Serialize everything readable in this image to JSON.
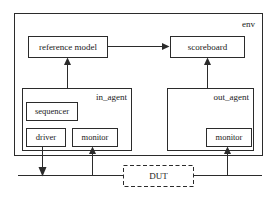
{
  "diagram": {
    "colors": {
      "stroke": "#2b2b2b",
      "background": "#ffffff",
      "text": "#1a1a1a"
    },
    "containers": [
      {
        "id": "env",
        "label": "env",
        "style": "solid",
        "x": 14,
        "y": 13,
        "w": 248,
        "h": 142,
        "label_x": 255,
        "label_y": 25
      },
      {
        "id": "in_agent",
        "label": "in_agent",
        "style": "solid",
        "x": 22,
        "y": 88,
        "w": 109,
        "h": 62,
        "label_x": 126,
        "label_y": 99
      },
      {
        "id": "out_agent",
        "label": "out_agent",
        "style": "solid",
        "x": 167,
        "y": 88,
        "w": 86,
        "h": 62,
        "label_x": 248,
        "label_y": 99
      }
    ],
    "blocks": [
      {
        "id": "reference_model",
        "label": "reference model",
        "style": "solid",
        "x": 28,
        "y": 36,
        "w": 79,
        "h": 21,
        "font_size": 9
      },
      {
        "id": "scoreboard",
        "label": "scoreboard",
        "style": "solid",
        "x": 170,
        "y": 36,
        "w": 74,
        "h": 21,
        "font_size": 9
      },
      {
        "id": "sequencer",
        "label": "sequencer",
        "style": "solid",
        "x": 26,
        "y": 102,
        "w": 51,
        "h": 18,
        "font_size": 8.5
      },
      {
        "id": "driver",
        "label": "driver",
        "style": "solid",
        "x": 26,
        "y": 128,
        "w": 39,
        "h": 18,
        "font_size": 8.5
      },
      {
        "id": "in_monitor",
        "label": "monitor",
        "style": "solid",
        "x": 72,
        "y": 128,
        "w": 45,
        "h": 18,
        "font_size": 8.5
      },
      {
        "id": "out_monitor",
        "label": "monitor",
        "style": "solid",
        "x": 206,
        "y": 128,
        "w": 45,
        "h": 18,
        "font_size": 8.5
      },
      {
        "id": "dut",
        "label": "DUT",
        "style": "dashed",
        "x": 123,
        "y": 165,
        "w": 70,
        "h": 21,
        "font_size": 9
      }
    ],
    "connections": [
      {
        "id": "refmodel-to-scoreboard",
        "from": "reference_model",
        "to": "scoreboard",
        "arrow": "end",
        "direction": "right",
        "points": "107,46 168,46"
      },
      {
        "id": "in-monitor-to-refmodel",
        "from": "in_monitor",
        "to": "reference_model",
        "arrow": "end",
        "direction": "up",
        "points": "67,88 67,59"
      },
      {
        "id": "out-agent-to-scoreboard",
        "from": "out_agent",
        "to": "scoreboard",
        "arrow": "end",
        "direction": "up",
        "points": "207,88 207,59"
      },
      {
        "id": "driver-to-bus",
        "from": "driver",
        "to": "left_bus",
        "arrow": "end",
        "direction": "down",
        "points": "42,146 42,173"
      },
      {
        "id": "bus-to-in-monitor",
        "from": "left_bus",
        "to": "in_monitor",
        "arrow": "end",
        "direction": "up",
        "points": "92,175 92,148"
      },
      {
        "id": "bus-to-out-monitor",
        "from": "right_bus",
        "to": "out_monitor",
        "arrow": "end",
        "direction": "up",
        "points": "227,175 227,148"
      }
    ],
    "buses": [
      {
        "id": "left_bus",
        "label": "input interface bus",
        "points": "18,175 123,175"
      },
      {
        "id": "right_bus",
        "label": "output interface bus",
        "points": "193,175 262,175"
      }
    ]
  }
}
